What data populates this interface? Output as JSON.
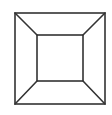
{
  "diagram": {
    "stroke_color": "#333333",
    "background": "#ffffff",
    "outer_square": {
      "x1": 15,
      "y1": 13,
      "x2": 105,
      "y2": 104
    },
    "inner_square": {
      "x1": 37,
      "y1": 35,
      "x2": 83,
      "y2": 81
    },
    "connectors": [
      {
        "name": "top-left",
        "from": [
          15,
          13
        ],
        "to": [
          37,
          35
        ]
      },
      {
        "name": "top-right",
        "from": [
          105,
          13
        ],
        "to": [
          83,
          35
        ]
      },
      {
        "name": "bottom-left",
        "from": [
          15,
          104
        ],
        "to": [
          37,
          81
        ]
      },
      {
        "name": "bottom-right",
        "from": [
          105,
          104
        ],
        "to": [
          83,
          81
        ]
      }
    ]
  }
}
